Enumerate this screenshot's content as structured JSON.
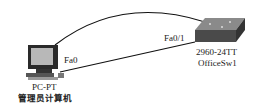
{
  "diagram": {
    "nodes": [
      {
        "id": "pc",
        "type": "pc-icon",
        "model": "PC-PT",
        "name": "管理员计算机",
        "port": "Fa0"
      },
      {
        "id": "switch",
        "type": "switch-icon",
        "model": "2960-24TT",
        "name": "OfficeSw1",
        "port": "Fa0/1"
      }
    ],
    "links": [
      {
        "from": "pc",
        "to": "switch",
        "style": "straight",
        "from_port": "Fa0",
        "to_port": "Fa0/1"
      },
      {
        "from": "pc",
        "to": "switch",
        "style": "curved"
      }
    ],
    "colors": {
      "line": "#111111",
      "switch_top": "#7a7a7a",
      "switch_side": "#4a4a4a",
      "pc_screen": "#b8b8b8"
    }
  }
}
